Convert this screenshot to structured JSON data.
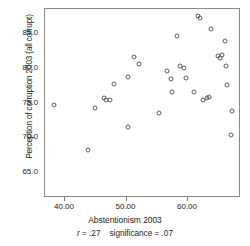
{
  "chart_data": {
    "type": "scatter",
    "title": "",
    "xlabel": "Abstentionism 2003",
    "ylabel": "Perception of corruption 2003 (all corrupt)",
    "xlim": [
      36.6,
      68.5
    ],
    "ylim": [
      63.0,
      88.2
    ],
    "xticks": [
      40.0,
      50.0,
      60.0
    ],
    "xtick_labels": [
      "40.00",
      "50.00",
      "60.00"
    ],
    "yticks": [
      65.0,
      70.0,
      75.0,
      80.0,
      85.0
    ],
    "ytick_labels": [
      "65.0",
      "70.0",
      "75.0",
      "80.0",
      "85.0"
    ],
    "grid": false,
    "legend": "none",
    "marker": "open-circle",
    "annotation": "r = .27   significance = .07",
    "statistics": {
      "r_symbol": "r",
      "r_equals": "= .27",
      "significance_label": "significance = .07",
      "r_value": 0.27,
      "significance_value": 0.07
    },
    "n_points": 41,
    "points": [
      {
        "x": 38.2,
        "y": 74.6
      },
      {
        "x": 43.7,
        "y": 68.1
      },
      {
        "x": 44.9,
        "y": 74.2
      },
      {
        "x": 46.4,
        "y": 75.6
      },
      {
        "x": 46.6,
        "y": 75.3
      },
      {
        "x": 47.3,
        "y": 75.3
      },
      {
        "x": 48.0,
        "y": 77.6
      },
      {
        "x": 50.2,
        "y": 78.7
      },
      {
        "x": 50.3,
        "y": 71.5
      },
      {
        "x": 51.3,
        "y": 81.6
      },
      {
        "x": 52.0,
        "y": 80.6
      },
      {
        "x": 55.3,
        "y": 73.5
      },
      {
        "x": 56.6,
        "y": 79.6
      },
      {
        "x": 57.3,
        "y": 78.4
      },
      {
        "x": 57.4,
        "y": 76.5
      },
      {
        "x": 58.2,
        "y": 84.5
      },
      {
        "x": 58.7,
        "y": 80.3
      },
      {
        "x": 59.4,
        "y": 79.9
      },
      {
        "x": 59.6,
        "y": 78.5
      },
      {
        "x": 61.0,
        "y": 76.5
      },
      {
        "x": 61.6,
        "y": 87.4
      },
      {
        "x": 62.0,
        "y": 87.1
      },
      {
        "x": 62.5,
        "y": 75.4
      },
      {
        "x": 63.1,
        "y": 75.7
      },
      {
        "x": 63.4,
        "y": 75.8
      },
      {
        "x": 63.8,
        "y": 85.6
      },
      {
        "x": 64.8,
        "y": 81.7
      },
      {
        "x": 65.2,
        "y": 81.4
      },
      {
        "x": 65.5,
        "y": 81.8
      },
      {
        "x": 66.0,
        "y": 83.8
      },
      {
        "x": 66.2,
        "y": 80.2
      },
      {
        "x": 66.4,
        "y": 77.5
      },
      {
        "x": 67.2,
        "y": 73.8
      },
      {
        "x": 67.0,
        "y": 70.3
      }
    ]
  },
  "axes": {
    "frame": {
      "left_px": 44,
      "top_px": 8,
      "width_px": 196,
      "height_px": 189
    },
    "x_scale": {
      "value_at_left_px": 64,
      "value_left": 40.0,
      "value_at_right_px": 187,
      "value_right": 60.0
    },
    "y_scale": {
      "value_at_top_px": 32,
      "value_top": 85.0,
      "value_at_bottom_px": 171,
      "value_bottom": 65.0
    }
  },
  "colors": {
    "marker_stroke": "#5a5a5a",
    "frame": "#8a8a8a",
    "tick": "#777777",
    "text": "#1a1a1a",
    "background": "#ffffff"
  }
}
